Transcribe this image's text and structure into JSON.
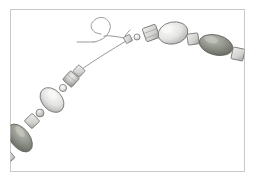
{
  "figure": {
    "background_color": "#ffffff",
    "frame": {
      "name": "illustration-border",
      "x": 10,
      "y": 9,
      "width": 235,
      "height": 163,
      "stroke_color": "#c9c9c9",
      "fill_color": "#ffffff",
      "stroke_width": 1
    },
    "palette": {
      "thread": "#8d8d8d",
      "outline": "#6d6d6d",
      "bead_light": "#e8e8e6",
      "bead_light_shadow": "#b8b9b5",
      "bead_mid": "#c4c6c2",
      "bead_dark": "#8a8d85",
      "bead_dark_shadow": "#6e716a",
      "highlight": "#f6f6f4",
      "cube_face": "#dcdcda",
      "cube_side": "#b0b1ad"
    },
    "thread": {
      "name": "beading-thread",
      "loop_path": "M 101 34 C 90 33 88 24 96 19 C 104 14 112 22 110 29 C 108 37 100 41 94 42",
      "tail_path": "M 94 42 C 99 41 106 39 112 38",
      "strand_path": "M 126 39 C 113 47 96 58 82 68",
      "stroke_color": "#8d8d8d",
      "stroke_width": 0.9
    },
    "strands": [
      {
        "name": "upper-right-strand",
        "description": "bead run climbing from the knot at centre toward the right frame edge",
        "beads": [
          {
            "name": "knot-bead",
            "shape": "cube",
            "cx": 128,
            "cy": 39,
            "w": 7,
            "h": 7,
            "angle": -28,
            "tone": "bead_mid"
          },
          {
            "name": "seed-bead",
            "shape": "round",
            "cx": 137,
            "cy": 37,
            "w": 6,
            "h": 6,
            "angle": -28,
            "tone": "bead_light"
          },
          {
            "name": "cube-bead",
            "shape": "cube",
            "cx": 151,
            "cy": 33,
            "w": 14,
            "h": 14,
            "angle": -20,
            "tone": "cube_face"
          },
          {
            "name": "oval-bead-large",
            "shape": "oval",
            "cx": 173,
            "cy": 33,
            "w": 30,
            "h": 22,
            "angle": -12,
            "tone": "bead_light"
          },
          {
            "name": "cube-bead",
            "shape": "cube",
            "cx": 193,
            "cy": 39,
            "w": 11,
            "h": 11,
            "angle": -8,
            "tone": "cube_face"
          },
          {
            "name": "oval-bead-dark",
            "shape": "oval",
            "cx": 216,
            "cy": 45,
            "w": 34,
            "h": 20,
            "angle": 14,
            "tone": "bead_dark"
          },
          {
            "name": "cube-bead-edge",
            "shape": "cube",
            "cx": 238,
            "cy": 54,
            "w": 12,
            "h": 12,
            "angle": 12,
            "tone": "cube_face"
          }
        ]
      },
      {
        "name": "lower-left-strand",
        "description": "bead run descending from mid-left toward the bottom-left frame corner",
        "beads": [
          {
            "name": "cube-bead",
            "shape": "cube",
            "cx": 79,
            "cy": 71,
            "w": 9,
            "h": 9,
            "angle": 42,
            "tone": "cube_face"
          },
          {
            "name": "cube-bead",
            "shape": "cube",
            "cx": 71,
            "cy": 79,
            "w": 12,
            "h": 12,
            "angle": 42,
            "tone": "bead_mid"
          },
          {
            "name": "seed-bead",
            "shape": "round",
            "cx": 63,
            "cy": 88,
            "w": 7,
            "h": 7,
            "angle": 42,
            "tone": "bead_light"
          },
          {
            "name": "oval-bead-large",
            "shape": "oval",
            "cx": 52,
            "cy": 100,
            "w": 28,
            "h": 20,
            "angle": 48,
            "tone": "bead_light"
          },
          {
            "name": "seed-bead",
            "shape": "round",
            "cx": 40,
            "cy": 113,
            "w": 8,
            "h": 8,
            "angle": 48,
            "tone": "bead_mid"
          },
          {
            "name": "cube-bead",
            "shape": "cube",
            "cx": 32,
            "cy": 121,
            "w": 11,
            "h": 11,
            "angle": 46,
            "tone": "cube_face"
          },
          {
            "name": "oval-bead-dark",
            "shape": "oval",
            "cx": 20,
            "cy": 138,
            "w": 32,
            "h": 19,
            "angle": 52,
            "tone": "bead_dark"
          },
          {
            "name": "strand-end",
            "shape": "cube",
            "cx": 8,
            "cy": 157,
            "w": 10,
            "h": 10,
            "angle": 50,
            "tone": "bead_mid"
          }
        ]
      }
    ]
  }
}
